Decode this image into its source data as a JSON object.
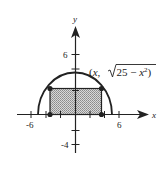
{
  "figure": {
    "axes": {
      "x_label": "x",
      "y_label": "y",
      "x_tick_labels": [
        "-6",
        "6"
      ],
      "y_tick_labels": [
        "6",
        "-4"
      ]
    },
    "curve": {
      "description": "upper semicircle y = sqrt(25 - x^2)",
      "radius": 5
    },
    "point_label": {
      "open": "(",
      "x": "x",
      "comma": ", ",
      "radicand": "25 − ",
      "x2": "x",
      "exp": "2",
      "close": ")"
    },
    "rectangle": {
      "description": "shaded inscribed rectangle with corners on the semicircle and x-axis",
      "fill": "#b0b0b0",
      "stroke": "#222222"
    },
    "colors": {
      "ink": "#222222",
      "shade": "#b0b0b0",
      "background": "#ffffff"
    }
  }
}
